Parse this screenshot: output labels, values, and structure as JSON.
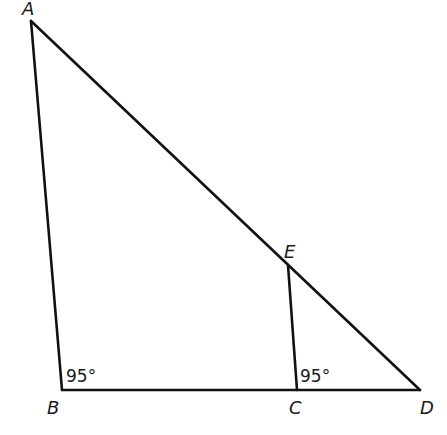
{
  "diagram": {
    "points": {
      "A": {
        "label": "A",
        "x": 31,
        "y": 21
      },
      "B": {
        "label": "B",
        "x": 62,
        "y": 390
      },
      "C": {
        "label": "C",
        "x": 297,
        "y": 390
      },
      "D": {
        "label": "D",
        "x": 420,
        "y": 390
      },
      "E": {
        "label": "E",
        "x": 288,
        "y": 265
      }
    },
    "segments": [
      "AB",
      "BD",
      "AD",
      "EC"
    ],
    "angles": {
      "B": {
        "label": "95°",
        "vertex": "B"
      },
      "C": {
        "label": "95°",
        "vertex": "C"
      }
    }
  }
}
